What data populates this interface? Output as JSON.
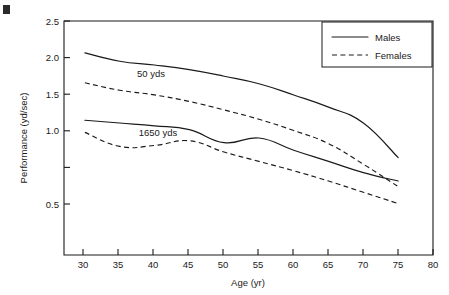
{
  "figure": {
    "corner_mark": "",
    "background_color": "#ffffff",
    "ink_color": "#1a1a1a"
  },
  "chart_data": {
    "type": "line",
    "title": "",
    "xlabel": "Age (yr)",
    "ylabel": "Performance (yd/sec)",
    "xlim": [
      27,
      80
    ],
    "ylim": [
      0.0,
      2.5
    ],
    "xticks": [
      30,
      35,
      40,
      45,
      50,
      55,
      60,
      65,
      70,
      75,
      80
    ],
    "xtick_labels": [
      "30",
      "35",
      "40",
      "45",
      "50",
      "55",
      "60",
      "65",
      "70",
      "75",
      "80"
    ],
    "yticks": [
      0.5,
      1.0,
      1.5,
      2.0,
      2.5
    ],
    "ytick_labels": [
      "0.5",
      "1.0",
      "1.5",
      "2.0",
      "2.5"
    ],
    "grid": false,
    "legend_position": "top-right",
    "x": [
      30,
      35,
      40,
      45,
      50,
      55,
      60,
      65,
      70,
      75
    ],
    "series": [
      {
        "name": "50 yds Males",
        "event": "50 yds",
        "sex": "Males",
        "style": "solid",
        "values": [
          2.16,
          2.07,
          2.03,
          1.98,
          1.91,
          1.83,
          1.71,
          1.58,
          1.41,
          1.04
        ]
      },
      {
        "name": "50 yds Females",
        "event": "50 yds",
        "sex": "Females",
        "style": "dashed",
        "values": [
          1.84,
          1.76,
          1.71,
          1.64,
          1.55,
          1.45,
          1.33,
          1.19,
          0.97,
          0.73
        ]
      },
      {
        "name": "1650 yds Males",
        "event": "1650 yds",
        "sex": "Males",
        "style": "solid",
        "values": [
          1.44,
          1.41,
          1.38,
          1.34,
          1.2,
          1.25,
          1.12,
          1.0,
          0.88,
          0.79
        ]
      },
      {
        "name": "1650 yds Females",
        "event": "1650 yds",
        "sex": "Females",
        "style": "dashed",
        "values": [
          1.31,
          1.16,
          1.17,
          1.22,
          1.1,
          1.0,
          0.9,
          0.79,
          0.67,
          0.55
        ]
      }
    ],
    "annotations": [
      {
        "text": "50 yds",
        "x": 39.5,
        "y": 1.9
      },
      {
        "text": "1650 yds",
        "x": 40.5,
        "y": 1.27
      }
    ],
    "legend": [
      {
        "label": "Males",
        "style": "solid"
      },
      {
        "label": "Females",
        "style": "dashed"
      }
    ]
  }
}
